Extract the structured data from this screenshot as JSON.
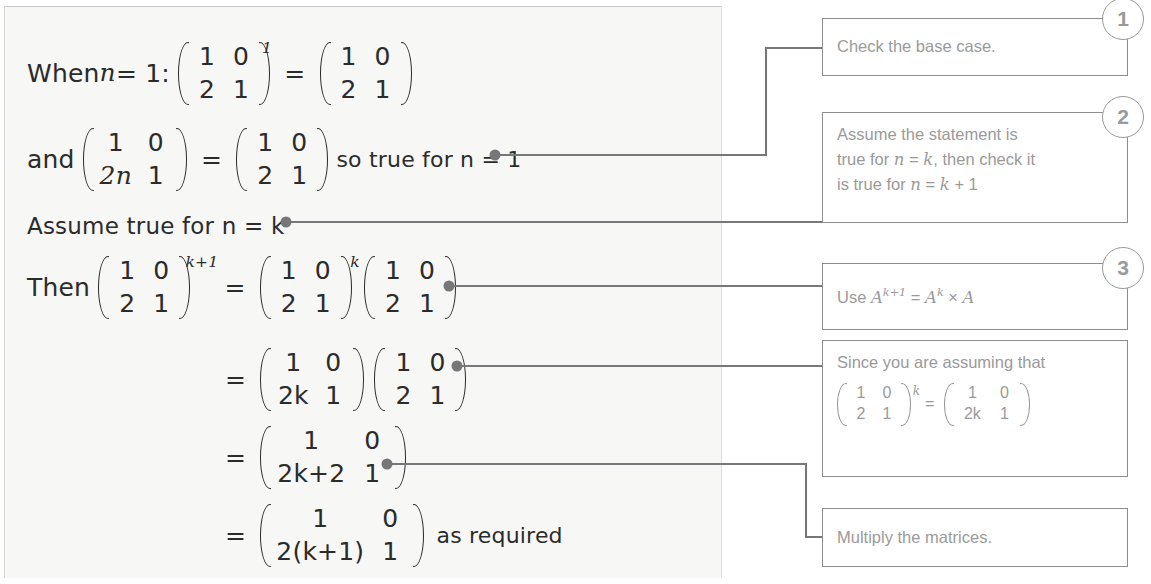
{
  "panel": {
    "name": "worked-solution-panel",
    "lines": [
      {
        "id": "line-base-case",
        "prefix": "When ",
        "var": "n",
        "eq": " = 1:",
        "matrices": [
          {
            "rows": [
              [
                "1",
                "0"
              ],
              [
                "2",
                "1"
              ]
            ],
            "exponent": "1"
          },
          {
            "rows": [
              [
                "1",
                "0"
              ],
              [
                "2",
                "1"
              ]
            ],
            "exponent": ""
          }
        ],
        "operator": "=",
        "suffix": ""
      },
      {
        "id": "line-formula-check",
        "prefix": "and ",
        "matrices": [
          {
            "rows": [
              [
                "1",
                "0"
              ],
              [
                "2n",
                "1"
              ]
            ],
            "exponent": ""
          },
          {
            "rows": [
              [
                "1",
                "0"
              ],
              [
                "2",
                "1"
              ]
            ],
            "exponent": ""
          }
        ],
        "operator": "=",
        "suffix": "so true for n = 1"
      },
      {
        "id": "line-assume",
        "text": "Assume true for n = k"
      },
      {
        "id": "line-then",
        "prefix": "Then ",
        "matrices": [
          {
            "rows": [
              [
                "1",
                "0"
              ],
              [
                "2",
                "1"
              ]
            ],
            "exponent": "k+1"
          },
          {
            "rows": [
              [
                "1",
                "0"
              ],
              [
                "2",
                "1"
              ]
            ],
            "exponent": "k"
          },
          {
            "rows": [
              [
                "1",
                "0"
              ],
              [
                "2",
                "1"
              ]
            ],
            "exponent": ""
          }
        ],
        "operator": "="
      },
      {
        "id": "line-sub",
        "prefix": "",
        "matrices": [
          {
            "rows": [
              [
                "1",
                "0"
              ],
              [
                "2k",
                "1"
              ]
            ],
            "exponent": ""
          },
          {
            "rows": [
              [
                "1",
                "0"
              ],
              [
                "2",
                "1"
              ]
            ],
            "exponent": ""
          }
        ],
        "operator": "="
      },
      {
        "id": "line-product",
        "matrices": [
          {
            "rows": [
              [
                "1",
                "0"
              ],
              [
                "2k+2",
                "1"
              ]
            ],
            "exponent": ""
          }
        ],
        "operator": "="
      },
      {
        "id": "line-final",
        "matrices": [
          {
            "rows": [
              [
                "1",
                "0"
              ],
              [
                "2(k+1)",
                "1"
              ]
            ],
            "exponent": ""
          }
        ],
        "operator": "=",
        "suffix": "as required"
      }
    ]
  },
  "callouts": [
    {
      "number": "1",
      "name": "callout-check-base-case",
      "text": "Check the base case."
    },
    {
      "number": "2",
      "name": "callout-assume-statement",
      "line1_a": "Assume the statement is",
      "line2_a": "true for ",
      "line2_var1": "n",
      "line2_b": " = ",
      "line2_var2": "k",
      "line2_c": ", then check it",
      "line3_a": "is true for ",
      "line3_var1": "n",
      "line3_b": " = ",
      "line3_var2": "k",
      "line3_c": " + 1"
    },
    {
      "number": "3",
      "name": "callout-use-power-rule",
      "prefix": "Use ",
      "a1": "A",
      "sup1": "k+1",
      "eq": " = ",
      "a2": "A",
      "sup2": "k",
      "times": " × ",
      "a3": "A"
    },
    {
      "number": "",
      "name": "callout-since-assuming",
      "text": "Since you are assuming that",
      "matrices": [
        {
          "rows": [
            [
              "1",
              "0"
            ],
            [
              "2",
              "1"
            ]
          ],
          "exponent": "k"
        },
        {
          "rows": [
            [
              "1",
              "0"
            ],
            [
              "2k",
              "1"
            ]
          ],
          "exponent": ""
        }
      ],
      "operator": "="
    },
    {
      "number": "",
      "name": "callout-multiply-matrices",
      "text": "Multiply the matrices."
    }
  ],
  "colors": {
    "panel_bg": "#f7f7f5",
    "ink": "#2b2b2b",
    "callout_border": "#8d8d8d",
    "callout_text": "#9a9a9a",
    "connector": "#77777a"
  }
}
